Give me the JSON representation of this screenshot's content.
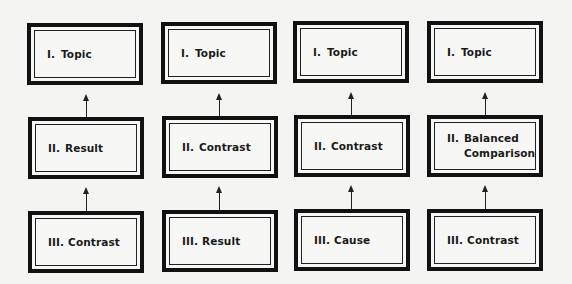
{
  "diagram": {
    "type": "essay-structure-flow",
    "columns": [
      {
        "boxes": [
          {
            "numeral": "I.",
            "text": "Topic"
          },
          {
            "numeral": "II.",
            "text": "Result"
          },
          {
            "numeral": "III.",
            "text": "Contrast"
          }
        ]
      },
      {
        "boxes": [
          {
            "numeral": "I.",
            "text": "Topic"
          },
          {
            "numeral": "II.",
            "text": "Contrast"
          },
          {
            "numeral": "III.",
            "text": "Result"
          }
        ]
      },
      {
        "boxes": [
          {
            "numeral": "I.",
            "text": "Topic"
          },
          {
            "numeral": "II.",
            "text": "Contrast"
          },
          {
            "numeral": "III.",
            "text": "Cause"
          }
        ]
      },
      {
        "boxes": [
          {
            "numeral": "I.",
            "text": "Topic"
          },
          {
            "numeral": "II.",
            "text": "Balanced\nComparison"
          },
          {
            "numeral": "III.",
            "text": "Contrast"
          }
        ]
      }
    ],
    "arrows": "each lower box points upward to the box above it",
    "colors": {
      "line": "#111111",
      "background": "#f4f4f2"
    }
  }
}
